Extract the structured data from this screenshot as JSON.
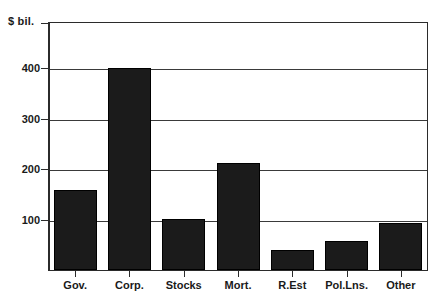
{
  "chart_data": {
    "type": "bar",
    "title": "",
    "subtitle": "",
    "xlabel": "",
    "ylabel": "$ bil.",
    "unit_caption": "$ bil.",
    "categories": [
      "Gov.",
      "Corp.",
      "Stocks",
      "Mort.",
      "R.Est",
      "Pol.Lns.",
      "Other"
    ],
    "values": [
      157,
      397,
      100,
      211,
      40,
      57,
      92
    ],
    "yticks": [
      100,
      200,
      300,
      400
    ],
    "ytick_labels": [
      "100",
      "200",
      "300",
      "400"
    ],
    "ylim": [
      0,
      490
    ],
    "xlim_note": "categorical",
    "grid": true,
    "grid_axis": "y",
    "legend": null,
    "legend_position": "none",
    "series": [
      {
        "name": "Assets",
        "values": [
          157,
          397,
          100,
          211,
          40,
          57,
          92
        ]
      }
    ],
    "bar_color": "#1b1b1b",
    "background_color": "#ffffff",
    "axis_color": "#2b2b2b"
  },
  "colors": {
    "bar": "#1b1b1b",
    "axis": "#2b2b2b",
    "grid": "#3a3a3a",
    "text": "#1a1a1a",
    "background": "#ffffff"
  }
}
